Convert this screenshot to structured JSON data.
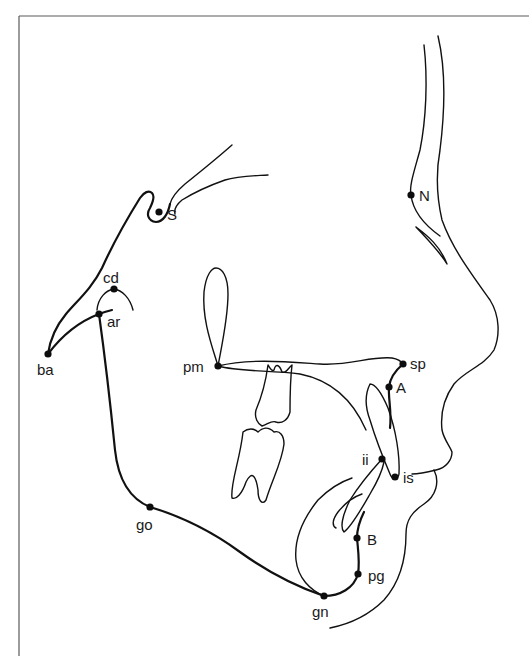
{
  "diagram": {
    "type": "cephalometric-tracing",
    "colors": {
      "line": "#111111",
      "frame": "#5a5a5a",
      "background": "#ffffff"
    },
    "landmarks": [
      {
        "id": "S",
        "label": "S",
        "x": 159,
        "y": 212,
        "lx": 167,
        "ly": 220
      },
      {
        "id": "N",
        "label": "N",
        "x": 411,
        "y": 195,
        "lx": 419,
        "ly": 201
      },
      {
        "id": "cd",
        "label": "cd",
        "x": 114,
        "y": 289,
        "lx": 103,
        "ly": 283
      },
      {
        "id": "ar",
        "label": "ar",
        "x": 99,
        "y": 314,
        "lx": 107,
        "ly": 327
      },
      {
        "id": "ba",
        "label": "ba",
        "x": 48,
        "y": 354,
        "lx": 37,
        "ly": 375
      },
      {
        "id": "pm",
        "label": "pm",
        "x": 218,
        "y": 366,
        "lx": 183,
        "ly": 372
      },
      {
        "id": "sp",
        "label": "sp",
        "x": 403,
        "y": 364,
        "lx": 410,
        "ly": 369
      },
      {
        "id": "A",
        "label": "A",
        "x": 389,
        "y": 387,
        "lx": 396,
        "ly": 393
      },
      {
        "id": "ii",
        "label": "ii",
        "x": 382,
        "y": 459,
        "lx": 362,
        "ly": 465
      },
      {
        "id": "is",
        "label": "is",
        "x": 395,
        "y": 477,
        "lx": 403,
        "ly": 483
      },
      {
        "id": "go",
        "label": "go",
        "x": 150,
        "y": 507,
        "lx": 136,
        "ly": 530
      },
      {
        "id": "B",
        "label": "B",
        "x": 357,
        "y": 538,
        "lx": 367,
        "ly": 545
      },
      {
        "id": "pg",
        "label": "pg",
        "x": 358,
        "y": 574,
        "lx": 368,
        "ly": 581
      },
      {
        "id": "gn",
        "label": "gn",
        "x": 324,
        "y": 596,
        "lx": 312,
        "ly": 617
      }
    ]
  }
}
